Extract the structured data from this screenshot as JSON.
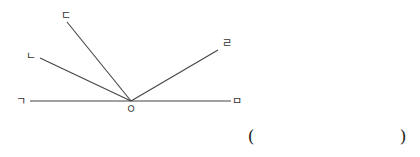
{
  "diagram": {
    "vertex": {
      "label": "ㅇ",
      "x": 131,
      "y": 101
    },
    "rays": [
      {
        "id": "giyeok",
        "label": "ㄱ",
        "end_x": 30,
        "end_y": 101,
        "label_x": 21,
        "label_y": 101
      },
      {
        "id": "nieun",
        "label": "ㄴ",
        "end_x": 40,
        "end_y": 58,
        "label_x": 31,
        "label_y": 56
      },
      {
        "id": "digeut",
        "label": "ㄷ",
        "end_x": 67,
        "end_y": 22,
        "label_x": 66,
        "label_y": 15
      },
      {
        "id": "rieul",
        "label": "ㄹ",
        "end_x": 218,
        "end_y": 50,
        "label_x": 227,
        "label_y": 43
      },
      {
        "id": "mieum",
        "label": "ㅁ",
        "end_x": 231,
        "end_y": 101,
        "label_x": 237,
        "label_y": 101
      }
    ],
    "line_color": "#444444"
  },
  "answer": {
    "open": "(",
    "close": ")",
    "value": ""
  }
}
